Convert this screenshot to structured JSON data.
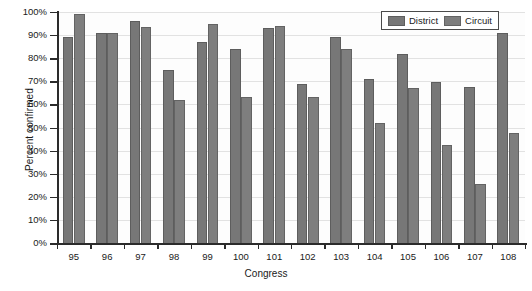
{
  "chart_data": {
    "type": "bar",
    "title": "",
    "xlabel": "Congress",
    "ylabel": "Percent confirmed",
    "categories": [
      "95",
      "96",
      "97",
      "98",
      "99",
      "100",
      "101",
      "102",
      "103",
      "104",
      "105",
      "106",
      "107",
      "108"
    ],
    "series": [
      {
        "name": "District",
        "color": "#777777",
        "values": [
          89,
          91,
          96,
          75,
          87,
          84,
          93,
          69,
          89,
          71,
          82,
          69.5,
          67.5,
          91
        ]
      },
      {
        "name": "Circuit",
        "color": "#7e7e7e",
        "values": [
          99,
          91,
          93.5,
          62,
          95,
          63,
          94,
          63,
          84,
          52,
          67,
          42.5,
          25.5,
          47.5
        ]
      }
    ],
    "ylim": [
      0,
      100
    ],
    "ytick_labels": [
      "0%",
      "10%",
      "20%",
      "30%",
      "40%",
      "50%",
      "60%",
      "70%",
      "80%",
      "90%",
      "100%"
    ],
    "ytick_values": [
      0,
      10,
      20,
      30,
      40,
      50,
      60,
      70,
      80,
      90,
      100
    ],
    "grid": true,
    "legend_position": "top-right",
    "legend_entries": [
      "District",
      "Circuit"
    ]
  },
  "legend": {
    "district_label": "District",
    "circuit_label": "Circuit"
  },
  "axes": {
    "y_title": "Percent confirmed",
    "x_title": "Congress"
  }
}
